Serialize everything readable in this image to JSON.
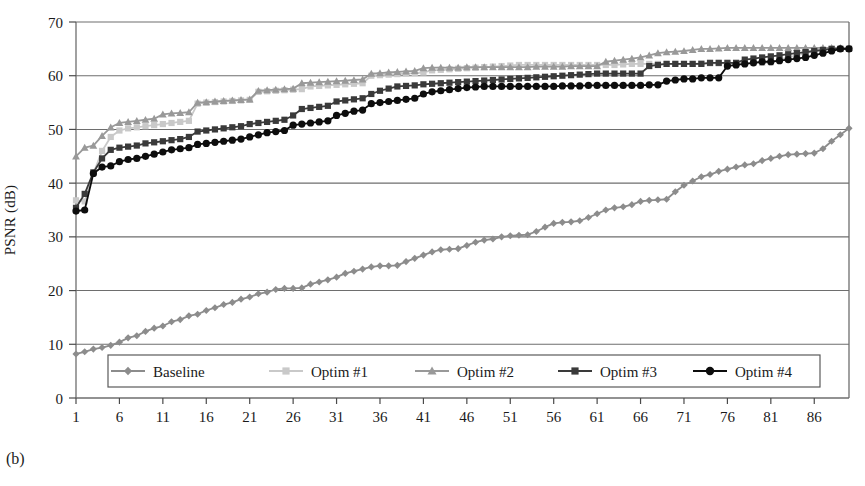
{
  "figure": {
    "caption": "(b)",
    "ylabel": "PSNR (dB)"
  },
  "chart_data": {
    "type": "line",
    "title": "",
    "xlabel": "",
    "ylabel": "PSNR (dB)",
    "xlim": [
      1,
      90
    ],
    "ylim": [
      0,
      70
    ],
    "ytick_step": 10,
    "yticks": [
      0,
      10,
      20,
      30,
      40,
      50,
      60,
      70
    ],
    "xticks": [
      1,
      6,
      11,
      16,
      21,
      26,
      31,
      36,
      41,
      46,
      51,
      56,
      61,
      66,
      71,
      76,
      81,
      86
    ],
    "grid": "horizontal",
    "legend_position": "bottom-inside",
    "legend_entries": [
      "Baseline",
      "Optim #1",
      "Optim #2",
      "Optim #3",
      "Optim #4"
    ],
    "x": [
      1,
      2,
      3,
      4,
      5,
      6,
      7,
      8,
      9,
      10,
      11,
      12,
      13,
      14,
      15,
      16,
      17,
      18,
      19,
      20,
      21,
      22,
      23,
      24,
      25,
      26,
      27,
      28,
      29,
      30,
      31,
      32,
      33,
      34,
      35,
      36,
      37,
      38,
      39,
      40,
      41,
      42,
      43,
      44,
      45,
      46,
      47,
      48,
      49,
      50,
      51,
      52,
      53,
      54,
      55,
      56,
      57,
      58,
      59,
      60,
      61,
      62,
      63,
      64,
      65,
      66,
      67,
      68,
      69,
      70,
      71,
      72,
      73,
      74,
      75,
      76,
      77,
      78,
      79,
      80,
      81,
      82,
      83,
      84,
      85,
      86,
      87,
      88,
      89,
      90
    ],
    "series": [
      {
        "name": "Baseline",
        "color": "#8c8c8c",
        "marker": "diamond",
        "values": [
          8.2,
          8.6,
          9.1,
          9.4,
          9.8,
          10.4,
          11.2,
          11.6,
          12.4,
          13.0,
          13.4,
          14.2,
          14.6,
          15.3,
          15.6,
          16.3,
          16.8,
          17.4,
          17.8,
          18.4,
          18.8,
          19.4,
          19.7,
          20.2,
          20.4,
          20.4,
          20.5,
          21.2,
          21.6,
          22.0,
          22.5,
          23.2,
          23.6,
          24.0,
          24.4,
          24.6,
          24.6,
          24.7,
          25.4,
          26.0,
          26.6,
          27.2,
          27.6,
          27.7,
          27.8,
          28.4,
          29.0,
          29.4,
          29.6,
          30.0,
          30.2,
          30.3,
          30.4,
          31.0,
          31.8,
          32.5,
          32.7,
          32.8,
          33.0,
          33.6,
          34.3,
          35.0,
          35.4,
          35.6,
          36.0,
          36.6,
          36.8,
          36.9,
          37.0,
          38.4,
          39.6,
          40.4,
          41.2,
          41.6,
          42.2,
          42.6,
          43.0,
          43.4,
          43.6,
          44.2,
          44.6,
          45.0,
          45.3,
          45.4,
          45.5,
          45.6,
          46.4,
          47.8,
          49.0,
          50.2
        ]
      },
      {
        "name": "Optim #1",
        "color": "#c9c9c9",
        "marker": "square",
        "values": [
          36.8,
          36.6,
          41.8,
          46.0,
          48.6,
          49.8,
          50.2,
          50.4,
          50.6,
          50.8,
          51.0,
          51.2,
          51.4,
          51.6,
          54.8,
          55.0,
          55.1,
          55.2,
          55.3,
          55.4,
          55.5,
          57.0,
          57.1,
          57.2,
          57.3,
          57.4,
          57.5,
          58.0,
          58.1,
          58.2,
          58.3,
          58.4,
          58.5,
          58.6,
          60.0,
          60.1,
          60.2,
          60.3,
          60.4,
          60.5,
          60.6,
          61.0,
          61.1,
          61.2,
          61.3,
          61.4,
          61.5,
          61.6,
          61.7,
          61.8,
          61.9,
          62.0,
          62.0,
          62.0,
          62.0,
          62.0,
          62.0,
          62.0,
          62.0,
          62.0,
          62.0,
          62.0,
          62.0,
          62.1,
          62.2,
          62.2,
          62.2,
          62.2,
          62.2,
          62.2,
          62.2,
          62.2,
          62.3,
          62.3,
          62.3,
          62.3,
          62.3,
          62.4,
          62.4,
          62.4,
          62.5,
          63.0,
          63.4,
          63.8,
          64.2,
          64.6,
          64.8,
          65.0,
          65.0,
          65.0
        ]
      },
      {
        "name": "Optim #2",
        "color": "#999999",
        "marker": "triangle",
        "values": [
          45.0,
          46.6,
          47.0,
          48.8,
          50.4,
          51.2,
          51.4,
          51.6,
          51.8,
          52.0,
          52.8,
          53.0,
          53.1,
          53.2,
          55.0,
          55.1,
          55.2,
          55.3,
          55.4,
          55.5,
          55.6,
          57.2,
          57.3,
          57.4,
          57.5,
          57.6,
          58.6,
          58.7,
          58.8,
          58.9,
          59.0,
          59.1,
          59.2,
          59.3,
          60.4,
          60.5,
          60.6,
          60.7,
          60.8,
          60.9,
          61.4,
          61.5,
          61.5,
          61.5,
          61.5,
          61.6,
          61.6,
          61.6,
          61.6,
          61.6,
          61.6,
          61.6,
          61.6,
          61.7,
          61.7,
          61.7,
          61.7,
          61.8,
          61.8,
          61.8,
          61.8,
          62.6,
          62.8,
          63.0,
          63.2,
          63.4,
          63.8,
          64.2,
          64.4,
          64.5,
          64.6,
          64.8,
          65.0,
          65.0,
          65.1,
          65.2,
          65.2,
          65.2,
          65.2,
          65.2,
          65.2,
          65.2,
          65.2,
          65.2,
          65.2,
          65.2,
          65.2,
          65.2,
          65.2,
          65.2
        ]
      },
      {
        "name": "Optim #3",
        "color": "#3a3a3a",
        "marker": "square",
        "values": [
          35.4,
          38.0,
          42.0,
          44.6,
          46.2,
          46.6,
          46.8,
          47.0,
          47.4,
          47.6,
          47.8,
          48.0,
          48.2,
          48.6,
          49.6,
          49.8,
          50.0,
          50.2,
          50.4,
          50.6,
          51.0,
          51.2,
          51.4,
          51.6,
          51.8,
          52.6,
          53.8,
          54.0,
          54.2,
          54.4,
          55.2,
          55.4,
          55.6,
          55.8,
          56.6,
          57.2,
          57.6,
          58.0,
          58.1,
          58.2,
          58.4,
          58.5,
          58.6,
          58.7,
          58.8,
          58.9,
          59.0,
          59.1,
          59.2,
          59.3,
          59.4,
          59.5,
          59.6,
          59.7,
          59.8,
          59.9,
          60.0,
          60.1,
          60.2,
          60.3,
          60.4,
          60.4,
          60.4,
          60.4,
          60.4,
          60.4,
          61.8,
          62.0,
          62.2,
          62.2,
          62.2,
          62.2,
          62.2,
          62.4,
          62.4,
          62.4,
          62.4,
          63.0,
          63.2,
          63.4,
          63.6,
          63.8,
          64.0,
          64.2,
          64.4,
          64.6,
          64.8,
          65.0,
          65.0,
          65.0
        ]
      },
      {
        "name": "Optim #4",
        "color": "#0d0d0d",
        "marker": "circle",
        "values": [
          34.8,
          35.0,
          41.8,
          43.0,
          43.2,
          44.0,
          44.4,
          44.6,
          45.0,
          45.4,
          45.8,
          46.2,
          46.4,
          46.6,
          47.2,
          47.4,
          47.6,
          47.8,
          48.0,
          48.2,
          48.6,
          49.0,
          49.4,
          49.6,
          49.8,
          50.8,
          51.0,
          51.2,
          51.4,
          51.6,
          52.6,
          53.0,
          53.4,
          53.6,
          54.8,
          55.0,
          55.2,
          55.4,
          55.6,
          55.8,
          56.6,
          57.0,
          57.2,
          57.4,
          57.6,
          57.8,
          57.9,
          58.0,
          58.0,
          58.0,
          58.0,
          58.0,
          58.0,
          58.0,
          58.0,
          58.0,
          58.1,
          58.1,
          58.1,
          58.2,
          58.2,
          58.2,
          58.2,
          58.2,
          58.2,
          58.2,
          58.3,
          58.3,
          59.0,
          59.2,
          59.4,
          59.4,
          59.6,
          59.6,
          59.6,
          61.8,
          62.0,
          62.2,
          62.4,
          62.6,
          62.6,
          62.8,
          63.0,
          63.2,
          63.4,
          63.8,
          64.2,
          64.6,
          65.0,
          65.0
        ]
      }
    ]
  }
}
